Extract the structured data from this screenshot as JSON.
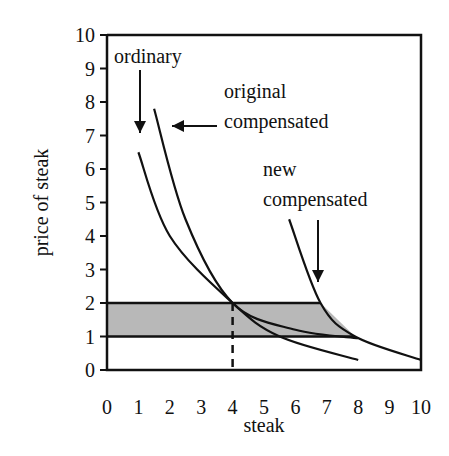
{
  "chart_data": {
    "type": "line",
    "title": "",
    "xlabel": "steak",
    "ylabel": "price of steak",
    "xlim": [
      0,
      10
    ],
    "ylim": [
      0,
      10
    ],
    "xticks": [
      "0",
      "1",
      "2",
      "3",
      "4",
      "5",
      "6",
      "7",
      "8",
      "9",
      "10"
    ],
    "yticks": [
      "0",
      "1",
      "2",
      "3",
      "4",
      "5",
      "6",
      "7",
      "8",
      "9",
      "10"
    ],
    "series": [
      {
        "name": "ordinary",
        "x": [
          1,
          2,
          4,
          5.5,
          8
        ],
        "y": [
          6.5,
          4,
          2,
          1,
          0.3
        ]
      },
      {
        "name": "original compensated",
        "x": [
          1.5,
          2.5,
          4,
          6,
          8
        ],
        "y": [
          7.8,
          4.5,
          2,
          1.2,
          0.95
        ]
      },
      {
        "name": "new compensated",
        "x": [
          5.8,
          6.8,
          7.9,
          10
        ],
        "y": [
          4.5,
          2,
          1,
          0.3
        ]
      }
    ],
    "shaded_region": {
      "y_from": 1,
      "y_to": 2,
      "x_from": 0,
      "bounded_by": "new compensated"
    },
    "reference_line": {
      "x": 4,
      "style": "dashed"
    },
    "annotations": [
      {
        "text": "ordinary"
      },
      {
        "text_line1": "original",
        "text_line2": "compensated"
      },
      {
        "text_line1": "new",
        "text_line2": "compensated"
      }
    ]
  }
}
